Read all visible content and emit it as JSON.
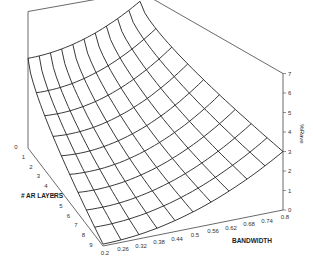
{
  "chart_data": {
    "type": "surface",
    "title": "",
    "xlabel": "BANDWIDTH",
    "ylabel": "# AR LAYERS",
    "zlabel": "%Rave",
    "x_ticks": [
      "0.2",
      "0.26",
      "0.32",
      "0.38",
      "0.44",
      "0.5",
      "0.56",
      "0.62",
      "0.68",
      "0.74",
      "0.8"
    ],
    "y_ticks": [
      "0",
      "1",
      "2",
      "3",
      "4",
      "5",
      "5",
      "6",
      "7",
      "8",
      "9"
    ],
    "z_ticks": [
      "0",
      "1",
      "2",
      "3",
      "4",
      "5",
      "6",
      "7"
    ],
    "zlim": [
      0,
      7
    ],
    "grid": false,
    "legend": "none",
    "x": [
      0.2,
      0.26,
      0.32,
      0.38,
      0.44,
      0.5,
      0.56,
      0.62,
      0.68,
      0.74,
      0.8
    ],
    "y": [
      0,
      1,
      2,
      3,
      4,
      5,
      6,
      7,
      8,
      9
    ],
    "z_corners": {
      "bw0.2_layers0": 4.6,
      "bw0.8_layers0": 6.5,
      "bw0.2_layers9": 0.1,
      "bw0.8_layers9": 3.0
    }
  }
}
